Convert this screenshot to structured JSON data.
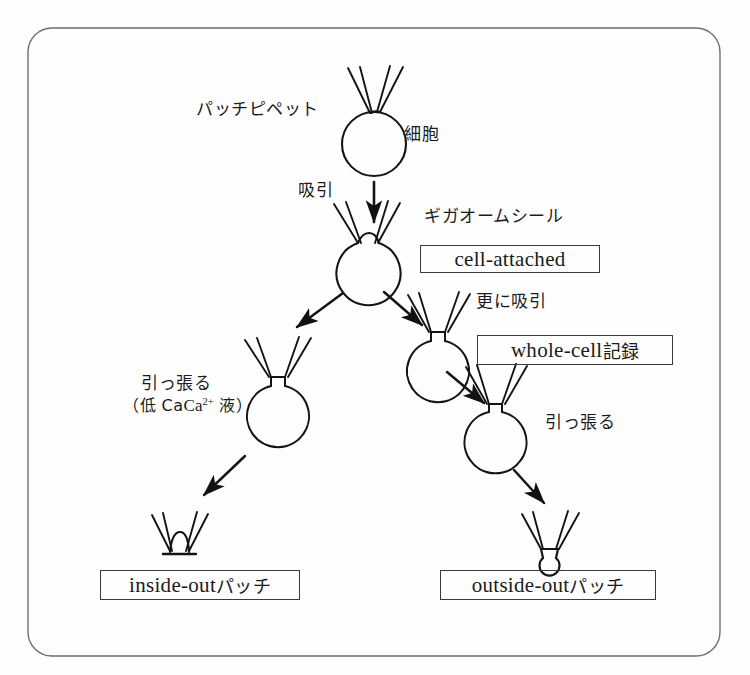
{
  "figure": {
    "frame": {
      "stroke": "#6b6b6b",
      "radius": 22,
      "x": 28,
      "y": 28,
      "width": 692,
      "height": 628
    },
    "ink_color": "#1b1b1b",
    "background": "#fefefe"
  },
  "labels": {
    "patch_pipette": "パッチピペット",
    "cell": "細胞",
    "suction": "吸引",
    "giga_ohm_seal": "ギガオームシール",
    "further_suction": "更に吸引",
    "pull_left": "引っ張る",
    "low_ca_solution": "（低 Ca2+ 液）",
    "low_ca_prefix": "（低 Ca",
    "low_ca_sup": "2+",
    "low_ca_suffix": " 液）",
    "pull_right": "引っ張る"
  },
  "boxes": [
    {
      "id": "cell-attached",
      "latin": "cell-attached",
      "jp": ""
    },
    {
      "id": "whole-cell",
      "latin": "whole-cell ",
      "jp": "記録"
    },
    {
      "id": "inside-out",
      "latin": "inside-out ",
      "jp": "パッチ"
    },
    {
      "id": "outside-out",
      "latin": "outside-out ",
      "jp": "パッチ"
    }
  ],
  "stages": [
    {
      "id": "stage-intact-cell",
      "name": "intact cell with pipette",
      "cx": 374,
      "cy": 143,
      "r": 32
    },
    {
      "id": "stage-cell-attached",
      "name": "cell-attached seal",
      "cx": 369,
      "cy": 262,
      "r": 32
    },
    {
      "id": "stage-vesicle-left",
      "name": "excised membrane vesicle (left branch)",
      "cx": 278,
      "cy": 404,
      "r": 31
    },
    {
      "id": "stage-whole-cell",
      "name": "whole-cell ruptured patch",
      "cx": 438,
      "cy": 355,
      "r": 31
    },
    {
      "id": "stage-pulled-cell",
      "name": "cell pulled away on pipette",
      "cx": 495,
      "cy": 427,
      "r": 31
    },
    {
      "id": "stage-inside-out",
      "name": "inside-out patch dome",
      "cx": 177,
      "cy": 540
    },
    {
      "id": "stage-outside-out",
      "name": "outside-out patch vesicle",
      "cx": 548,
      "cy": 540
    }
  ],
  "arrows": [
    {
      "id": "arrow-suction",
      "from": "intact-cell",
      "to": "cell-attached"
    },
    {
      "id": "arrow-to-vesicle",
      "from": "cell-attached",
      "to": "vesicle-left"
    },
    {
      "id": "arrow-to-whole-cell",
      "from": "cell-attached",
      "to": "whole-cell"
    },
    {
      "id": "arrow-to-inside-out",
      "from": "vesicle-left",
      "to": "inside-out"
    },
    {
      "id": "arrow-to-pulled-cell",
      "from": "whole-cell",
      "to": "pulled-cell"
    },
    {
      "id": "arrow-to-outside-out",
      "from": "pulled-cell",
      "to": "outside-out"
    }
  ]
}
